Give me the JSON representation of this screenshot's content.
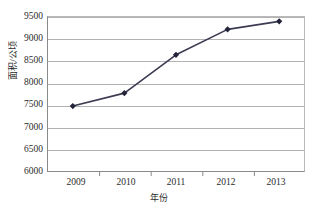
{
  "chart_data": {
    "type": "line",
    "title": "",
    "xlabel": "年份",
    "ylabel": "面积/公顷",
    "categories": [
      "2009",
      "2010",
      "2011",
      "2012",
      "2013"
    ],
    "x": [
      2009,
      2010,
      2011,
      2012,
      2013
    ],
    "values": [
      7480,
      7770,
      8630,
      9200,
      9380
    ],
    "series": [
      {
        "name": "面积/公顷",
        "values": [
          7480,
          7770,
          8630,
          9200,
          9380
        ]
      }
    ],
    "ylim": [
      6000,
      9500
    ],
    "ytick_labels": [
      "9500",
      "9000",
      "8500",
      "8000",
      "7500",
      "7000",
      "6500",
      "6000"
    ],
    "ytick_values": [
      9500,
      9000,
      8500,
      8000,
      7500,
      7000,
      6500,
      6000
    ],
    "xtick_labels": [
      "2009",
      "2010",
      "2011",
      "2012",
      "2013"
    ],
    "grid": true,
    "grid_axis": "y",
    "legend": false,
    "legend_position": "none",
    "marker": "diamond",
    "line_color": "#3b3b52",
    "marker_color": "#23233a",
    "grid_color": "#b3b3b3",
    "axis_color": "#8a8a8a",
    "background": "#ffffff"
  },
  "axes": {
    "y_title": "面积/公顷",
    "x_title": "年份"
  }
}
